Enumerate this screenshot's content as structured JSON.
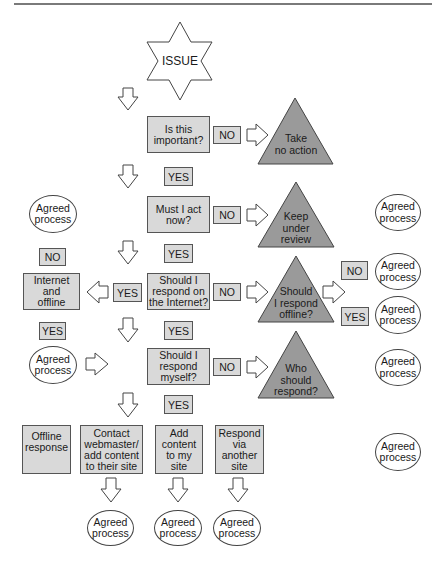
{
  "diagram": {
    "start": "ISSUE",
    "decisions": [
      {
        "id": "important",
        "text": "Is this\nimportant?",
        "no_label": "NO",
        "no_outcome": "Take\nno action",
        "yes_label": "YES"
      },
      {
        "id": "act_now",
        "text": "Must I act\nnow?",
        "no_label": "NO",
        "no_outcome": "Keep\nunder\nreview",
        "yes_label": "YES"
      },
      {
        "id": "internet",
        "text": "Should I\nrespond on\nthe Internet?",
        "no_label": "NO",
        "no_outcome": "Should\nI respond\noffline?",
        "yes_label": "YES"
      },
      {
        "id": "myself",
        "text": "Should I\nrespond\nmyself?",
        "no_label": "NO",
        "no_outcome": "Who\nshould\nrespond?",
        "yes_label": "YES"
      }
    ],
    "offline_branch": {
      "no_label": "NO",
      "yes_label": "YES"
    },
    "internet_yes": {
      "label": "YES",
      "box": "Internet\nand\noffline",
      "top_no": "NO",
      "bottom_yes": "YES"
    },
    "actions": [
      {
        "text": "Offline\nresponse"
      },
      {
        "text": "Contact\nwebmaster/\nadd content\nto their site"
      },
      {
        "text": "Add\ncontent\nto my\nsite"
      },
      {
        "text": "Respond\nvia\nanother\nsite"
      }
    ],
    "agreed_process": "Agreed\nprocess"
  }
}
